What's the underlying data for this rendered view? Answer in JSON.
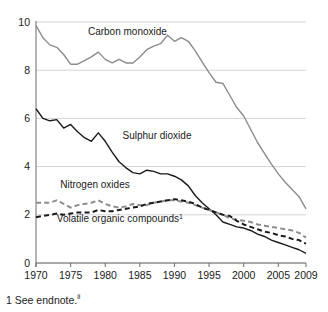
{
  "chart_data": {
    "type": "line",
    "title": "",
    "xlabel": "",
    "ylabel": "",
    "xlim": [
      1970,
      2009
    ],
    "ylim": [
      0,
      10
    ],
    "grid": true,
    "grid_axis": "y",
    "legend": "inline-labels",
    "yticks": [
      "0",
      "2",
      "4",
      "6",
      "8",
      "10"
    ],
    "ytick_values": [
      0,
      2,
      4,
      6,
      8,
      10
    ],
    "xticks": [
      "1970",
      "1975",
      "1980",
      "1985",
      "1990",
      "1995",
      "2000",
      "2005",
      "2009"
    ],
    "xtick_values": [
      1970,
      1975,
      1980,
      1985,
      1990,
      1995,
      2000,
      2005,
      2009
    ],
    "x": [
      1970,
      1971,
      1972,
      1973,
      1974,
      1975,
      1976,
      1977,
      1978,
      1979,
      1980,
      1981,
      1982,
      1983,
      1984,
      1985,
      1986,
      1987,
      1988,
      1989,
      1990,
      1991,
      1992,
      1993,
      1994,
      1995,
      1996,
      1997,
      1998,
      1999,
      2000,
      2001,
      2002,
      2003,
      2004,
      2005,
      2006,
      2007,
      2008,
      2009
    ],
    "series": [
      {
        "name": "Carbon monoxide",
        "color": "#8c8c8c",
        "style": "solid",
        "label_x": 1977.5,
        "label_y": 9.45,
        "values": [
          9.85,
          9.35,
          9.05,
          8.95,
          8.65,
          8.25,
          8.25,
          8.4,
          8.55,
          8.75,
          8.45,
          8.3,
          8.45,
          8.3,
          8.3,
          8.55,
          8.85,
          9.0,
          9.1,
          9.45,
          9.2,
          9.35,
          9.2,
          8.8,
          8.35,
          7.9,
          7.5,
          7.45,
          6.95,
          6.45,
          6.1,
          5.55,
          5.0,
          4.55,
          4.1,
          3.7,
          3.35,
          3.05,
          2.75,
          2.25
        ]
      },
      {
        "name": "Sulphur dioxide",
        "color": "#1a1a1a",
        "style": "solid",
        "label_x": 1982.5,
        "label_y": 5.15,
        "values": [
          6.4,
          6.0,
          5.9,
          5.95,
          5.6,
          5.75,
          5.45,
          5.2,
          5.05,
          5.4,
          5.05,
          4.6,
          4.2,
          3.95,
          3.75,
          3.7,
          3.85,
          3.8,
          3.7,
          3.7,
          3.6,
          3.45,
          3.2,
          2.8,
          2.5,
          2.25,
          2.0,
          1.7,
          1.6,
          1.5,
          1.45,
          1.35,
          1.2,
          1.1,
          0.95,
          0.85,
          0.75,
          0.65,
          0.55,
          0.4
        ]
      },
      {
        "name": "Nitrogen oxides",
        "color": "#8c8c8c",
        "style": "dashed",
        "label_x": 1973.5,
        "label_y": 3.1,
        "values": [
          2.5,
          2.5,
          2.5,
          2.6,
          2.45,
          2.3,
          2.4,
          2.45,
          2.5,
          2.6,
          2.45,
          2.35,
          2.3,
          2.35,
          2.45,
          2.4,
          2.4,
          2.5,
          2.55,
          2.6,
          2.6,
          2.55,
          2.5,
          2.4,
          2.3,
          2.2,
          2.1,
          2.0,
          1.85,
          1.8,
          1.75,
          1.7,
          1.6,
          1.55,
          1.5,
          1.45,
          1.4,
          1.35,
          1.25,
          1.05
        ]
      },
      {
        "name": "Volatile organic compounds",
        "color": "#1a1a1a",
        "style": "dashed",
        "footnote_marker": "1",
        "label_x": 1973.0,
        "label_y": 1.7,
        "values": [
          1.9,
          1.95,
          2.0,
          2.05,
          2.0,
          2.05,
          2.1,
          2.1,
          2.1,
          2.2,
          2.15,
          2.15,
          2.2,
          2.25,
          2.3,
          2.35,
          2.45,
          2.5,
          2.55,
          2.6,
          2.65,
          2.6,
          2.55,
          2.45,
          2.3,
          2.2,
          2.1,
          2.0,
          1.95,
          1.75,
          1.6,
          1.5,
          1.4,
          1.3,
          1.25,
          1.15,
          1.1,
          1.0,
          0.95,
          0.8
        ]
      }
    ]
  },
  "footnote": {
    "text": "1 See endnote.",
    "marker": "ii"
  },
  "axis": {
    "y_axis_name": "y-axis",
    "x_axis_name": "x-axis"
  }
}
